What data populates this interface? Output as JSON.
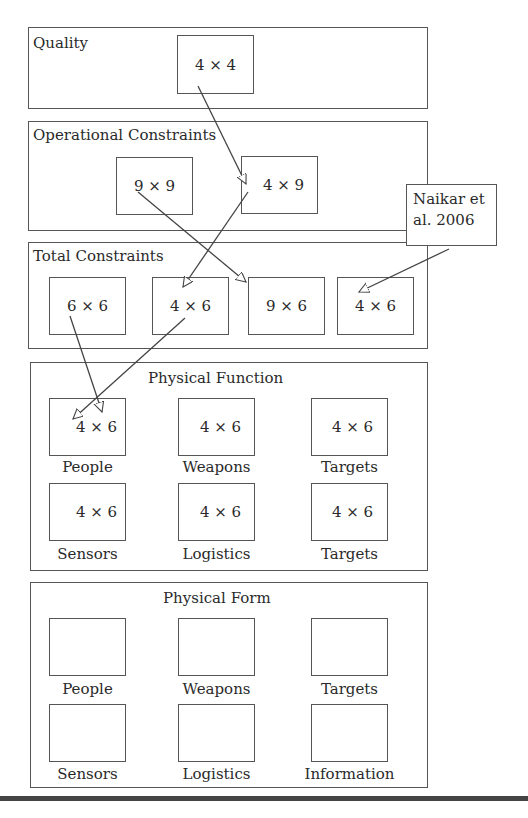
{
  "diagram": {
    "layers": [
      {
        "title": "Quality",
        "cells": [
          {
            "value": "4 × 4"
          }
        ]
      },
      {
        "title": "Operational Constraints",
        "cells": [
          {
            "value": "9 × 9"
          },
          {
            "value": "4 × 9"
          }
        ]
      },
      {
        "title": "Total Constraints",
        "cells": [
          {
            "value": "6 × 6"
          },
          {
            "value": "4 × 6"
          },
          {
            "value": "9 × 6"
          },
          {
            "value": "4 × 6"
          }
        ]
      },
      {
        "title": "Physical Function",
        "cells": [
          {
            "value": "4 × 6",
            "label": "People"
          },
          {
            "value": "4 × 6",
            "label": "Weapons"
          },
          {
            "value": "4 × 6",
            "label": "Targets"
          },
          {
            "value": "4 × 6",
            "label": "Sensors"
          },
          {
            "value": "4 × 6",
            "label": "Logistics"
          },
          {
            "value": "4 × 6",
            "label": "Targets"
          }
        ]
      },
      {
        "title": "Physical Form",
        "cells": [
          {
            "value": "",
            "label": "People"
          },
          {
            "value": "",
            "label": "Weapons"
          },
          {
            "value": "",
            "label": "Targets"
          },
          {
            "value": "",
            "label": "Sensors"
          },
          {
            "value": "",
            "label": "Logistics"
          },
          {
            "value": "",
            "label": "Information"
          }
        ]
      }
    ],
    "callout": {
      "line1": "Naikar et",
      "line2": "al. 2006"
    },
    "arrows": [
      {
        "from": "Quality 4 × 4",
        "to": "Operational Constraints 4 × 9"
      },
      {
        "from": "Operational Constraints 9 × 9",
        "to": "Total Constraints 9 × 6"
      },
      {
        "from": "Operational Constraints 4 × 9",
        "to": "Total Constraints 4 × 6 (2nd)"
      },
      {
        "from": "Naikar et al. 2006",
        "to": "Total Constraints 4 × 6 (4th)"
      },
      {
        "from": "Total Constraints 6 × 6",
        "to": "Physical Function People 4 × 6"
      },
      {
        "from": "Total Constraints 4 × 6 (2nd)",
        "to": "Physical Function People 4 × 6"
      }
    ],
    "colors": {
      "line": "#555555",
      "text": "#2a2a2a",
      "rule": "#444444"
    }
  }
}
